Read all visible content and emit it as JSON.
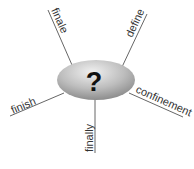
{
  "diagram": {
    "type": "spider-word-map",
    "center": {
      "label": "?",
      "shape": "ellipse",
      "fill_light": "#e8e8e8",
      "fill_dark": "#8a8a8a"
    },
    "branches": [
      {
        "label": "finale",
        "position": "top-left"
      },
      {
        "label": "define",
        "position": "top-right"
      },
      {
        "label": "confinement",
        "position": "right"
      },
      {
        "label": "finish",
        "position": "left"
      },
      {
        "label": "finally",
        "position": "bottom"
      }
    ],
    "line_color": "#555555"
  }
}
